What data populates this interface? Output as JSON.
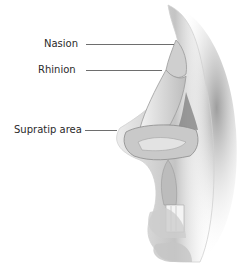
{
  "diagram": {
    "labels": [
      {
        "id": "nasion",
        "text": "Nasion",
        "x": 44,
        "y": 38,
        "line_x1": 86,
        "line_x2": 174,
        "line_y": 44
      },
      {
        "id": "rhinion",
        "text": "Rhinion",
        "x": 38,
        "y": 64,
        "line_x1": 86,
        "line_x2": 162,
        "line_y": 70
      },
      {
        "id": "supratip",
        "text": "Supratip area",
        "x": 14,
        "y": 124,
        "line_x1": 85,
        "line_x2": 117,
        "line_y": 130
      }
    ],
    "colors": {
      "skin_shadow": "#b9b9b9",
      "cartilage": "#d6d6d6",
      "cavity": "#8a8a8a",
      "leader_line": "#6e6e6e",
      "label_text": "#2a2a2a"
    }
  }
}
